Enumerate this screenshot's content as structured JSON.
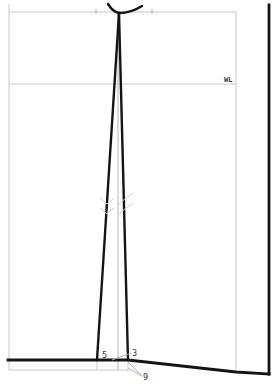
{
  "diagram": {
    "type": "garment-pattern-draft",
    "colors": {
      "background": "#ffffff",
      "outline": "#141414",
      "guide": "#c8c8c8"
    },
    "labels": {
      "waist_line": "WL",
      "point_5": "5",
      "point_3": "3",
      "point_9": "9"
    },
    "elements": {
      "frame": {
        "left": 9,
        "top": 12,
        "right": 236,
        "bottom": 370
      },
      "top_guide_ticks_x": [
        96,
        152
      ],
      "waist_line_y": 84,
      "right_edge_x": 269,
      "dart": {
        "apex": [
          119,
          13
        ],
        "left_foot": [
          97,
          360
        ],
        "right_foot": [
          128,
          360
        ]
      },
      "center_guide_x": 118,
      "hem_points": [
        [
          8,
          360
        ],
        [
          128,
          360
        ],
        [
          236,
          372
        ],
        [
          269,
          374
        ]
      ]
    }
  }
}
